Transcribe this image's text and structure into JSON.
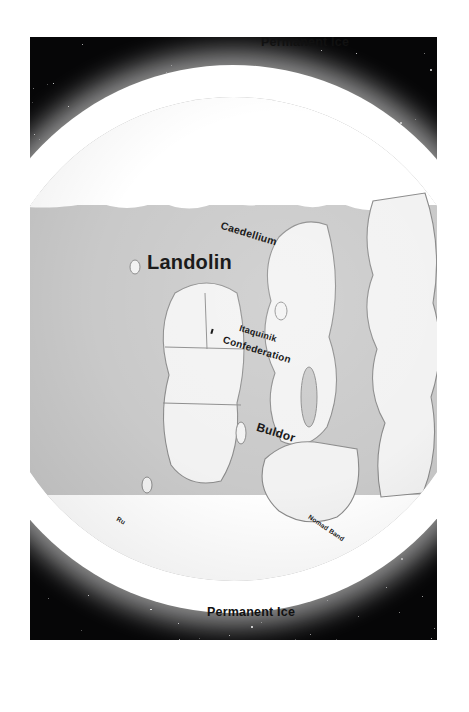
{
  "scene": {
    "kind": "planet-globe-map",
    "background": "starfield",
    "space_color": "#060607",
    "ice_color": "#ffffff",
    "ocean_color": "#c9c9c9",
    "land_color": "#f2f2f2",
    "outline_color": "#8a8a8a",
    "label_color": "#1b1b1b",
    "page_color": "#ffffff",
    "orientation_note": "map rendered rotated 90 degrees clockwise"
  },
  "labels": {
    "ice_left": "Permanent Ice",
    "ice_right": "Permanent Ice",
    "landolin": "Landolin",
    "caedellium": "Caedellium",
    "itaquinik": "Itaquinik",
    "confederation": "Confederation",
    "buldor": "Buldor",
    "northern_band": "Nomad Band",
    "ru_region": "Ru"
  },
  "regions": [
    {
      "name": "Landolin",
      "type": "continent",
      "label_size": "large"
    },
    {
      "name": "Caedellium",
      "type": "island",
      "label_size": "small"
    },
    {
      "name": "Itaquinik Confederation",
      "type": "polity",
      "label_size": "small"
    },
    {
      "name": "Buldor",
      "type": "region",
      "label_size": "medium"
    },
    {
      "name": "Nomad Band",
      "type": "region",
      "label_size": "tiny"
    },
    {
      "name": "Permanent Ice",
      "type": "ice-cap",
      "label_size": "medium"
    }
  ]
}
